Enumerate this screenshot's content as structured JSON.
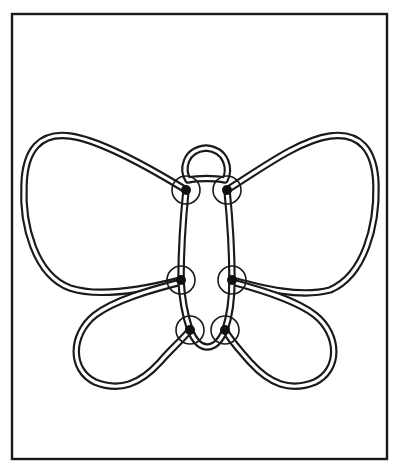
{
  "figure": {
    "frame": {
      "x": 12,
      "y": 14,
      "width": 375,
      "height": 445
    },
    "colors": {
      "line": "#1a1a1a",
      "background": "#ffffff"
    },
    "parts": {
      "head_loop": {
        "cx": 206,
        "cy": 160,
        "rx": 20,
        "ry": 13
      },
      "upper_left_wing": "large rounded wing extending to left edge",
      "upper_right_wing": "large rounded wing extending to right edge",
      "lower_left_wing": "smaller teardrop wing pointing lower-left",
      "lower_right_wing": "smaller teardrop wing pointing lower-right",
      "body": "two parallel wire rails joined at bottom"
    },
    "joints": [
      {
        "id": "upper-left",
        "cx": 186,
        "cy": 190,
        "r": 14
      },
      {
        "id": "upper-right",
        "cx": 227,
        "cy": 190,
        "r": 14
      },
      {
        "id": "middle-left",
        "cx": 181,
        "cy": 280,
        "r": 14
      },
      {
        "id": "middle-right",
        "cx": 232,
        "cy": 280,
        "r": 14
      },
      {
        "id": "lower-left",
        "cx": 190,
        "cy": 330,
        "r": 14
      },
      {
        "id": "lower-right",
        "cx": 225,
        "cy": 330,
        "r": 14
      }
    ]
  }
}
